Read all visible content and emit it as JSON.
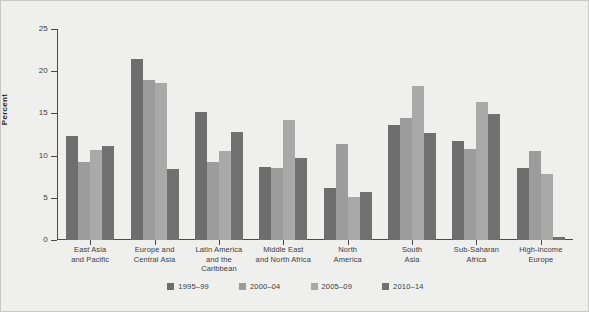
{
  "chart_data": {
    "type": "bar",
    "title": "",
    "xlabel": "",
    "ylabel": "Percent",
    "ylim": [
      0,
      25
    ],
    "yticks": [
      0,
      5,
      10,
      15,
      20,
      25
    ],
    "ytick_labels": [
      "0",
      "5",
      "10",
      "15",
      "20",
      "25"
    ],
    "grid": false,
    "legend_position": "bottom",
    "categories": [
      "East Asia\nand Pacific",
      "Europe and\nCentral Asia",
      "Latin America\nand the\nCaribbean",
      "Middle East\nand North Africa",
      "North\nAmerica",
      "South\nAsia",
      "Sub-Saharan\nAfrica",
      "High-income\nEurope"
    ],
    "series": [
      {
        "name": "1995–99",
        "color": "#6e6e6e",
        "values": [
          12.3,
          21.4,
          15.2,
          8.6,
          6.2,
          13.6,
          11.7,
          8.5
        ]
      },
      {
        "name": "2000–04",
        "color": "#9c9c9c",
        "values": [
          9.3,
          19.0,
          9.2,
          8.5,
          11.4,
          14.4,
          10.8,
          10.6
        ]
      },
      {
        "name": "2005–09",
        "color": "#a9a9a9",
        "values": [
          10.7,
          18.6,
          10.6,
          14.2,
          5.1,
          18.2,
          16.4,
          7.8
        ]
      },
      {
        "name": "2010–14",
        "color": "#717171",
        "values": [
          11.1,
          8.4,
          12.8,
          9.7,
          5.7,
          12.7,
          14.9,
          0.4
        ]
      }
    ]
  }
}
